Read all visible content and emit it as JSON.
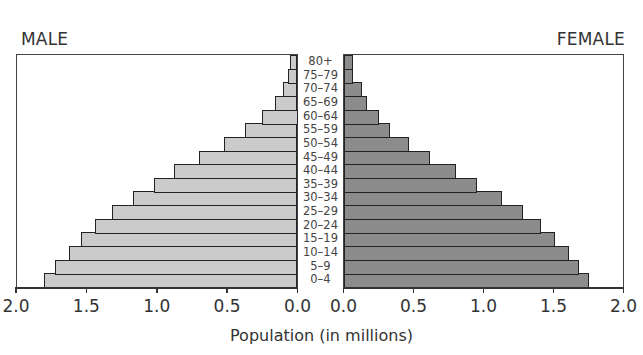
{
  "labels": {
    "male": "MALE",
    "female": "FEMALE",
    "xlabel": "Population (in millions)"
  },
  "colors": {
    "male_fill": "#cbcbcb",
    "female_fill": "#8c8c8c",
    "outline": "#222222"
  },
  "chart_data": {
    "type": "bar",
    "orientation": "horizontal-population-pyramid",
    "title": "",
    "xlabel": "Population (in millions)",
    "ylabel": "",
    "xlim": [
      0,
      2.0
    ],
    "x_ticks": [
      "2.0",
      "1.5",
      "1.0",
      "0.5",
      "0.0",
      "0.0",
      "0.5",
      "1.0",
      "1.5",
      "2.0"
    ],
    "grid": false,
    "legend": [
      "MALE",
      "FEMALE"
    ],
    "categories": [
      "0–4",
      "5–9",
      "10–14",
      "15–19",
      "20–24",
      "25–29",
      "30–34",
      "35–39",
      "40–44",
      "45–49",
      "50–54",
      "55–59",
      "60–64",
      "65–69",
      "70–74",
      "75–79",
      "80+"
    ],
    "series": [
      {
        "name": "MALE",
        "values": [
          1.8,
          1.72,
          1.62,
          1.54,
          1.44,
          1.32,
          1.17,
          1.02,
          0.88,
          0.7,
          0.52,
          0.37,
          0.25,
          0.16,
          0.1,
          0.07,
          0.05
        ]
      },
      {
        "name": "FEMALE",
        "values": [
          1.75,
          1.68,
          1.61,
          1.51,
          1.41,
          1.28,
          1.13,
          0.95,
          0.8,
          0.62,
          0.47,
          0.33,
          0.25,
          0.17,
          0.13,
          0.07,
          0.07
        ]
      }
    ]
  }
}
